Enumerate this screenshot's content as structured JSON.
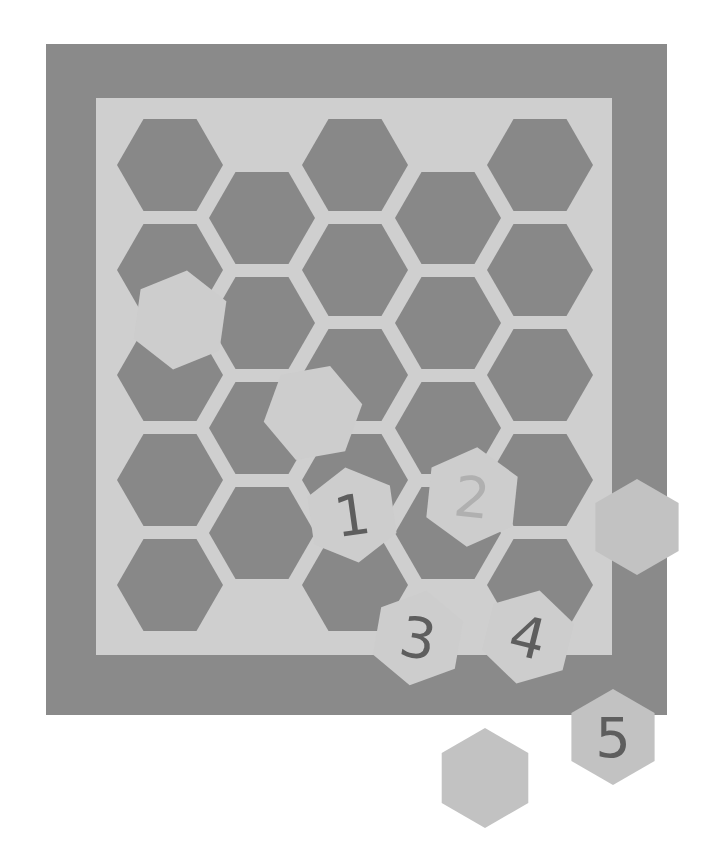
{
  "colors": {
    "background": "#ffffff",
    "board_outer": "#8a8a8a",
    "board_inner": "#cfcfcf",
    "hole": "#888888",
    "piece": "#cdcdcd",
    "piece_dark": "#c2c2c2",
    "digit": "#5e5e5e",
    "digit_faint": "#b0b0b0"
  },
  "board": {
    "outer": {
      "x": 46,
      "y": 44,
      "w": 621,
      "h": 671
    },
    "inner": {
      "x": 96,
      "y": 98,
      "w": 516,
      "h": 557
    }
  },
  "holes": [
    {
      "cx": 170,
      "cy": 165
    },
    {
      "cx": 170,
      "cy": 270
    },
    {
      "cx": 170,
      "cy": 375
    },
    {
      "cx": 170,
      "cy": 480
    },
    {
      "cx": 170,
      "cy": 585
    },
    {
      "cx": 262,
      "cy": 218
    },
    {
      "cx": 262,
      "cy": 323
    },
    {
      "cx": 262,
      "cy": 428
    },
    {
      "cx": 262,
      "cy": 533
    },
    {
      "cx": 355,
      "cy": 165
    },
    {
      "cx": 355,
      "cy": 270
    },
    {
      "cx": 355,
      "cy": 375
    },
    {
      "cx": 355,
      "cy": 480
    },
    {
      "cx": 355,
      "cy": 585
    },
    {
      "cx": 448,
      "cy": 218
    },
    {
      "cx": 448,
      "cy": 323
    },
    {
      "cx": 448,
      "cy": 428
    },
    {
      "cx": 448,
      "cy": 533
    },
    {
      "cx": 540,
      "cy": 165
    },
    {
      "cx": 540,
      "cy": 270
    },
    {
      "cx": 540,
      "cy": 375
    },
    {
      "cx": 540,
      "cy": 480
    },
    {
      "cx": 540,
      "cy": 585
    }
  ],
  "pieces": [
    {
      "id": "blank-a",
      "label": "",
      "cx": 180,
      "cy": 320,
      "r": 50,
      "rot": 8,
      "shade": "light"
    },
    {
      "id": "blank-b",
      "label": "",
      "cx": 313,
      "cy": 413,
      "r": 50,
      "rot": 20,
      "shade": "light"
    },
    {
      "id": "one",
      "label": "1",
      "cx": 352,
      "cy": 515,
      "r": 48,
      "rot": -8,
      "shade": "light",
      "digit": "dark"
    },
    {
      "id": "two",
      "label": "2",
      "cx": 472,
      "cy": 497,
      "r": 50,
      "rot": 6,
      "shade": "light",
      "digit": "faint"
    },
    {
      "id": "blank-c",
      "label": "",
      "cx": 637,
      "cy": 527,
      "r": 48,
      "rot": 0,
      "shade": "mid"
    },
    {
      "id": "three",
      "label": "3",
      "cx": 418,
      "cy": 638,
      "r": 48,
      "rot": 10,
      "shade": "light",
      "digit": "dark"
    },
    {
      "id": "four",
      "label": "4",
      "cx": 528,
      "cy": 637,
      "r": 48,
      "rot": 14,
      "shade": "light",
      "digit": "dark"
    },
    {
      "id": "five",
      "label": "5",
      "cx": 613,
      "cy": 737,
      "r": 48,
      "rot": 0,
      "shade": "mid",
      "digit": "dark"
    },
    {
      "id": "blank-d",
      "label": "",
      "cx": 485,
      "cy": 778,
      "r": 50,
      "rot": 0,
      "shade": "mid"
    }
  ]
}
